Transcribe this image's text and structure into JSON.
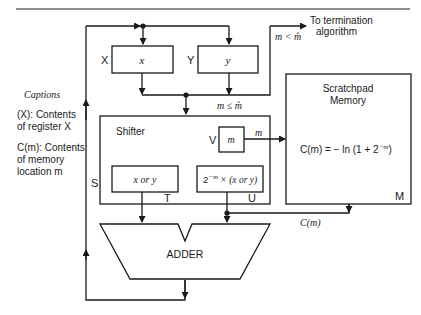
{
  "diagram": {
    "type": "block-diagram",
    "colors": {
      "stroke": "#1a1a1a",
      "background": "#ffffff"
    },
    "captions": {
      "title": "Captions",
      "line1a": "(X): Contents",
      "line1b": "of register X",
      "line2a": "C(m): Contents",
      "line2b": "of memory",
      "line2c": "location m"
    },
    "registers": {
      "x": {
        "name": "X",
        "content": "x"
      },
      "y": {
        "name": "Y",
        "content": "y"
      },
      "v": {
        "name": "V",
        "content": "m"
      }
    },
    "shifter": {
      "title": "Shifter",
      "side_label": "S",
      "out_t": {
        "content": "x or y",
        "label": "T"
      },
      "out_u": {
        "content_base": "2",
        "content_exp": "−m",
        "content_rest": " × (x or y)",
        "label": "U"
      }
    },
    "memory": {
      "title_line1": "Scratchpad",
      "title_line2": "Memory",
      "formula": "C(m) = − ln (1 + 2",
      "formula_exp": "−m",
      "formula_end": ")",
      "corner_label": "M"
    },
    "adder": {
      "label": "ADDER"
    },
    "signals": {
      "m_arrow": "m",
      "cm_arrow": "C(m)",
      "cond_le": "m ≤ m̂",
      "cond_lt": "m < m̂",
      "termination_line1": "To termination",
      "termination_line2": "algorithm"
    }
  }
}
